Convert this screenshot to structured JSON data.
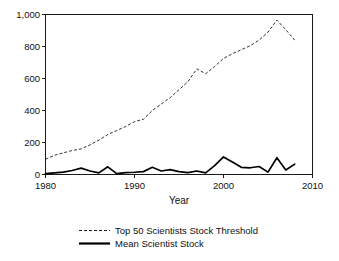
{
  "chart_data": {
    "type": "line",
    "title": "",
    "xlabel": "Year",
    "ylabel": "",
    "xlim": [
      1980,
      2010
    ],
    "ylim": [
      0,
      1000
    ],
    "grid": false,
    "legend_position": "bottom",
    "xticks": [
      1980,
      1990,
      2000,
      2010
    ],
    "xtick_labels": [
      "1980",
      "1990",
      "2000",
      "2010"
    ],
    "yticks": [
      0,
      200,
      400,
      600,
      800,
      1000
    ],
    "ytick_labels": [
      "0",
      "200",
      "400",
      "600",
      "800",
      "1,000"
    ],
    "x": [
      1980,
      1981,
      1982,
      1983,
      1984,
      1985,
      1986,
      1987,
      1988,
      1989,
      1990,
      1991,
      1992,
      1993,
      1994,
      1995,
      1996,
      1997,
      1998,
      1999,
      2000,
      2001,
      2002,
      2003,
      2004,
      2005,
      2006,
      2007,
      2008
    ],
    "series": [
      {
        "name": "Top 50 Scientists Stock Threshold",
        "style": "dashed",
        "color": "#1a1a1a",
        "values": [
          95,
          120,
          135,
          150,
          160,
          185,
          215,
          250,
          275,
          300,
          330,
          345,
          400,
          440,
          480,
          530,
          580,
          660,
          630,
          675,
          725,
          755,
          780,
          805,
          840,
          890,
          965,
          905,
          840
        ]
      },
      {
        "name": "Mean Scientist Stock",
        "style": "solid",
        "color": "#000000",
        "values": [
          5,
          10,
          15,
          25,
          40,
          22,
          10,
          48,
          5,
          12,
          14,
          18,
          45,
          22,
          30,
          18,
          12,
          22,
          10,
          55,
          110,
          78,
          45,
          42,
          50,
          15,
          105,
          28,
          65
        ]
      }
    ]
  },
  "legend": {
    "items": [
      {
        "label": "Top 50 Scientists Stock Threshold",
        "style": "dashed"
      },
      {
        "label": "Mean Scientist Stock",
        "style": "solid"
      }
    ]
  }
}
